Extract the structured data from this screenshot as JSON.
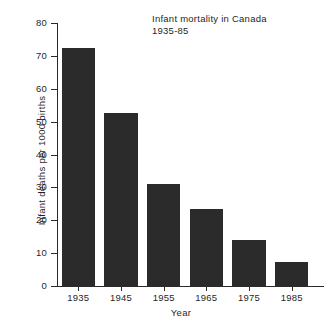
{
  "chart_data": {
    "type": "bar",
    "title": "Infant mortality in Canada",
    "subtitle": "1935-85",
    "xlabel": "Year",
    "ylabel": "Infant deaths per 1000 births",
    "categories": [
      "1935",
      "1945",
      "1955",
      "1965",
      "1975",
      "1985"
    ],
    "values": [
      72.3,
      52.5,
      31.0,
      23.4,
      14.0,
      7.3
    ],
    "ylim": [
      0,
      80
    ],
    "ytick_values": [
      0,
      10,
      20,
      30,
      40,
      50,
      60,
      70,
      80
    ],
    "ytick_labels": [
      "0",
      "10",
      "20",
      "30",
      "40",
      "50",
      "60",
      "70",
      "80"
    ],
    "grid": false,
    "legend": false,
    "bar_color": "#2b2b2b",
    "axis_color": "#2a2a2a",
    "background_color": "#ffffff"
  }
}
